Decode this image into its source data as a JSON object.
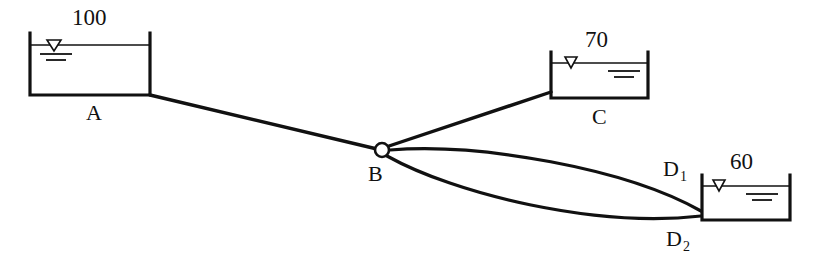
{
  "diagram": {
    "type": "hydraulic-pipe-network-schematic",
    "background_color": "#ffffff",
    "line_color": "#111111",
    "reservoirs": [
      {
        "id": "A",
        "label": "A",
        "head_label": "100",
        "head_value": 100,
        "x": 30,
        "y": 33,
        "width": 120,
        "height": 62,
        "water_line_y": 45,
        "marker": "water-level-triangle",
        "hatch_side": "left"
      },
      {
        "id": "C",
        "label": "C",
        "head_label": "70",
        "head_value": 70,
        "x": 551,
        "y": 52,
        "width": 97,
        "height": 46,
        "water_line_y": 63,
        "marker": "water-level-triangle",
        "hatch_side": "right"
      },
      {
        "id": "D",
        "label": "",
        "head_label": "60",
        "head_value": 60,
        "x": 702,
        "y": 175,
        "width": 88,
        "height": 45,
        "water_line_y": 186,
        "marker": "water-level-triangle",
        "hatch_side": "right"
      }
    ],
    "junction": {
      "id": "B",
      "label": "B",
      "x": 382,
      "y": 150,
      "radius": 7,
      "shape": "open-circle"
    },
    "pipes": [
      {
        "id": "AB",
        "label": "",
        "from": "A",
        "to": "B",
        "shape": "straight",
        "path": "M 150 95 L 377 149"
      },
      {
        "id": "BC",
        "label": "",
        "from": "B",
        "to": "C",
        "shape": "straight",
        "path": "M 388 147 L 551 92"
      },
      {
        "id": "D1",
        "label": "D",
        "sublabel": "1",
        "from": "B",
        "to": "D",
        "shape": "curved-upper",
        "path": "M 389 151 C 470 147, 620 170, 700 212"
      },
      {
        "id": "D2",
        "label": "D",
        "sublabel": "2",
        "from": "B",
        "to": "D",
        "shape": "curved-lower",
        "path": "M 387 155 C 460 190, 600 225, 700 216"
      }
    ],
    "labels": [
      {
        "name": "head-label-a",
        "text": "100",
        "x": 72,
        "y": 6
      },
      {
        "name": "reservoir-label-a",
        "text": "A",
        "x": 86,
        "y": 102
      },
      {
        "name": "head-label-c",
        "text": "70",
        "x": 585,
        "y": 28
      },
      {
        "name": "reservoir-label-c",
        "text": "C",
        "x": 592,
        "y": 106
      },
      {
        "name": "head-label-d",
        "text": "60",
        "x": 730,
        "y": 150
      },
      {
        "name": "junction-label-b",
        "text": "B",
        "x": 368,
        "y": 163
      },
      {
        "name": "pipe-label-d1",
        "text": "D",
        "sub": "1",
        "x": 663,
        "y": 158
      },
      {
        "name": "pipe-label-d2",
        "text": "D",
        "sub": "2",
        "x": 666,
        "y": 228
      }
    ]
  }
}
